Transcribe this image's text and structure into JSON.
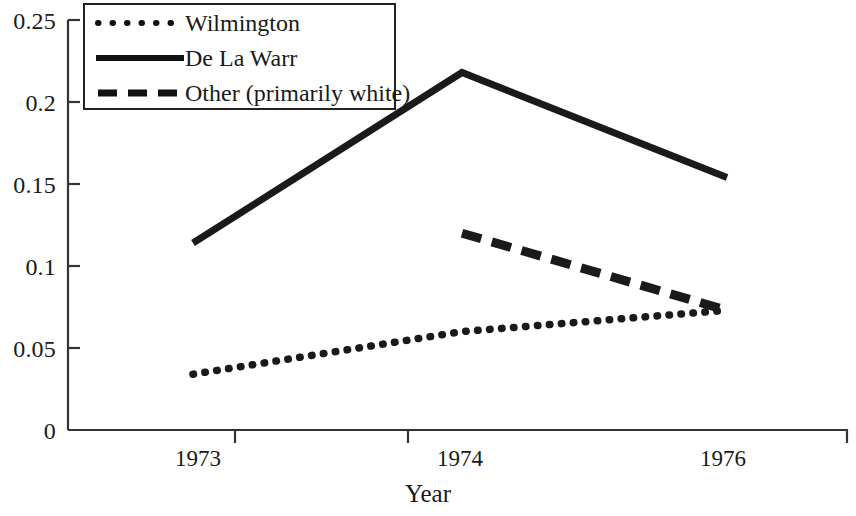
{
  "chart_data": {
    "type": "line",
    "title": "",
    "xlabel": "Year",
    "ylabel": "",
    "categories": [
      "1973",
      "1974",
      "1976"
    ],
    "x": [
      1973,
      1974,
      1976
    ],
    "series": [
      {
        "name": "Wilmington",
        "style": "dotted",
        "values": [
          0.034,
          0.06,
          0.073
        ]
      },
      {
        "name": "De La Warr",
        "style": "solid",
        "values": [
          0.114,
          0.218,
          0.154
        ]
      },
      {
        "name": "Other (primarily white)",
        "style": "dashed",
        "values": [
          null,
          0.12,
          0.073
        ]
      }
    ],
    "ylim": [
      0,
      0.25
    ],
    "yticks": [
      "0",
      "0.05",
      "0.1",
      "0.15",
      "0.2",
      "0.25"
    ],
    "ytick_values": [
      0,
      0.05,
      0.1,
      0.15,
      0.2,
      0.25
    ],
    "xtick_labels": [
      "1973",
      "1974",
      "1976"
    ],
    "grid": false,
    "legend_position": "top-left",
    "line_color": "#1a1a1a"
  },
  "axes": {
    "x_title": "Year",
    "y_tick_labels": [
      "0.25",
      "0.2",
      "0.15",
      "0.1",
      "0.05",
      "0"
    ],
    "x_tick_labels": [
      "1973",
      "1974",
      "1976"
    ]
  },
  "legend": {
    "entries": [
      {
        "label": "Wilmington",
        "style": "dotted"
      },
      {
        "label": "De La Warr",
        "style": "solid"
      },
      {
        "label": "Other (primarily white)",
        "style": "dashed"
      }
    ]
  }
}
